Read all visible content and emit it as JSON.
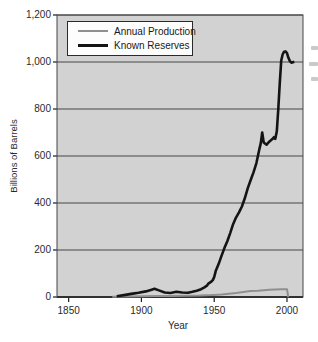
{
  "colors": {
    "plot_bg": "#d2d2d2",
    "gridline": "#474747",
    "axis_line": "#1c1c1c",
    "text": "#1f1f1f",
    "legend_bg": "#fdfdfd",
    "annual_production_line": "#8f8f8f",
    "known_reserves_line": "#141414"
  },
  "chart_data": {
    "type": "line",
    "title": "",
    "xlabel": "Year",
    "ylabel": "Billions of Barrels",
    "xlim": [
      1842,
      2011
    ],
    "ylim": [
      0,
      1200
    ],
    "grid": true,
    "legend_position": "top-left",
    "xticks": [
      {
        "value": 1850,
        "label": "1850"
      },
      {
        "value": 1900,
        "label": "1900"
      },
      {
        "value": 1950,
        "label": "1950"
      },
      {
        "value": 2000,
        "label": "2000"
      }
    ],
    "yticks": [
      {
        "value": 0,
        "label": "0"
      },
      {
        "value": 200,
        "label": "200"
      },
      {
        "value": 400,
        "label": "400"
      },
      {
        "value": 600,
        "label": "600"
      },
      {
        "value": 800,
        "label": "800"
      },
      {
        "value": 1000,
        "label": "1,000"
      },
      {
        "value": 1200,
        "label": "1,200"
      }
    ],
    "series": [
      {
        "name": "Annual Production",
        "color": "#8f8f8f",
        "width": 2,
        "points": [
          [
            1880,
            1
          ],
          [
            1890,
            2
          ],
          [
            1900,
            3
          ],
          [
            1910,
            4
          ],
          [
            1920,
            4
          ],
          [
            1930,
            5
          ],
          [
            1940,
            6
          ],
          [
            1948,
            8
          ],
          [
            1950,
            9
          ],
          [
            1955,
            11
          ],
          [
            1960,
            14
          ],
          [
            1965,
            17
          ],
          [
            1970,
            21
          ],
          [
            1975,
            25
          ],
          [
            1980,
            27
          ],
          [
            1984,
            29
          ],
          [
            1988,
            31
          ],
          [
            1992,
            32
          ],
          [
            1996,
            33
          ],
          [
            2000,
            33
          ],
          [
            2000.8,
            0
          ]
        ]
      },
      {
        "name": "Known Reserves",
        "color": "#141414",
        "width": 2.6,
        "points": [
          [
            1883,
            3
          ],
          [
            1888,
            8
          ],
          [
            1893,
            13
          ],
          [
            1898,
            18
          ],
          [
            1903,
            24
          ],
          [
            1907,
            31
          ],
          [
            1909,
            35
          ],
          [
            1912,
            28
          ],
          [
            1916,
            19
          ],
          [
            1920,
            17
          ],
          [
            1924,
            22
          ],
          [
            1928,
            19
          ],
          [
            1932,
            18
          ],
          [
            1935,
            22
          ],
          [
            1938,
            27
          ],
          [
            1941,
            33
          ],
          [
            1943,
            40
          ],
          [
            1945,
            48
          ],
          [
            1946,
            57
          ],
          [
            1948,
            65
          ],
          [
            1949,
            72
          ],
          [
            1950,
            85
          ],
          [
            1951,
            110
          ],
          [
            1953,
            140
          ],
          [
            1955,
            175
          ],
          [
            1957,
            208
          ],
          [
            1959,
            237
          ],
          [
            1961,
            272
          ],
          [
            1963,
            310
          ],
          [
            1965,
            338
          ],
          [
            1967,
            360
          ],
          [
            1969,
            385
          ],
          [
            1971,
            420
          ],
          [
            1973,
            462
          ],
          [
            1975,
            497
          ],
          [
            1977,
            530
          ],
          [
            1979,
            570
          ],
          [
            1980,
            600
          ],
          [
            1981,
            628
          ],
          [
            1982,
            655
          ],
          [
            1983,
            700
          ],
          [
            1984,
            658
          ],
          [
            1986,
            648
          ],
          [
            1988,
            662
          ],
          [
            1990,
            672
          ],
          [
            1991,
            680
          ],
          [
            1992,
            673
          ],
          [
            1993,
            705
          ],
          [
            1994,
            800
          ],
          [
            1995,
            905
          ],
          [
            1996,
            1005
          ],
          [
            1997,
            1032
          ],
          [
            1998,
            1044
          ],
          [
            1999,
            1045
          ],
          [
            2000,
            1038
          ],
          [
            2001,
            1018
          ],
          [
            2002,
            1004
          ],
          [
            2003,
            997
          ],
          [
            2005,
            1001
          ]
        ]
      }
    ]
  }
}
